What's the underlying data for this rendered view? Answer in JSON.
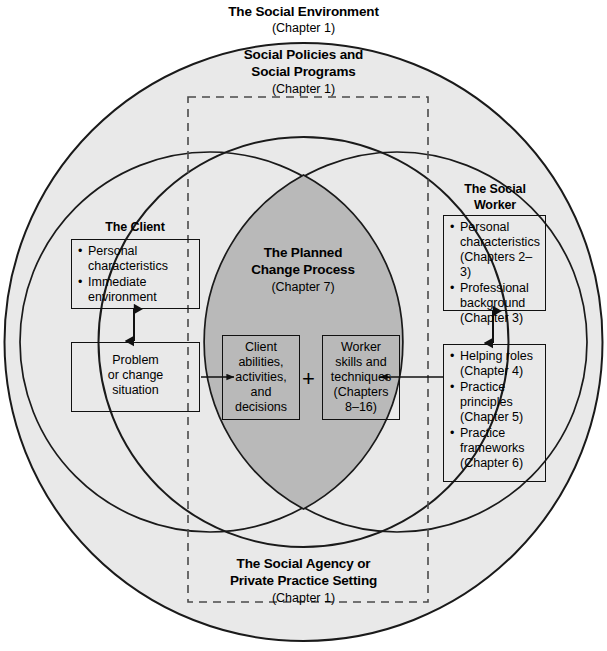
{
  "diagram": {
    "title": "The Social Environment",
    "outer_ring": {
      "label": "The Social Environment",
      "chapter": "(Chapter 1)"
    },
    "middle_ring": {
      "label_line1": "Social Policies and",
      "label_line2": "Social Programs",
      "chapter": "(Chapter 1)"
    },
    "dashed_region": {
      "label_line1": "The Social Agency or",
      "label_line2": "Private Practice Setting",
      "chapter": "(Chapter 1)"
    },
    "client": {
      "heading": "The Client",
      "attributes": [
        "Personal characteristics",
        "Immediate environment"
      ],
      "problem_box": {
        "line1": "Problem",
        "line2": "or change",
        "line3": "situation"
      }
    },
    "social_worker": {
      "heading_line1": "The Social",
      "heading_line2": "Worker",
      "attributes": [
        "Personal characteristics (Chapters 2–3)",
        "Professional background (Chapter 3)"
      ],
      "skills": [
        "Helping roles (Chapter 4)",
        "Practice principles (Chapter 5)",
        "Practice frameworks (Chapter 6)"
      ]
    },
    "center": {
      "heading_line1": "The Planned",
      "heading_line2": "Change Process",
      "chapter": "(Chapter 7)",
      "client_box": {
        "line1": "Client",
        "line2": "abilities,",
        "line3": "activities,",
        "line4": "and",
        "line5": "decisions"
      },
      "operator": "+",
      "worker_box": {
        "line1": "Worker",
        "line2": "skills and",
        "line3": "techniques",
        "line4": "(Chapters",
        "line5": "8–16)"
      }
    },
    "colors": {
      "background": "#ffffff",
      "ring_fill": "#e9e9e9",
      "lens_fill": "#b9b9b9",
      "stroke": "#1a1a1a",
      "dashed_stroke": "#555555"
    }
  }
}
